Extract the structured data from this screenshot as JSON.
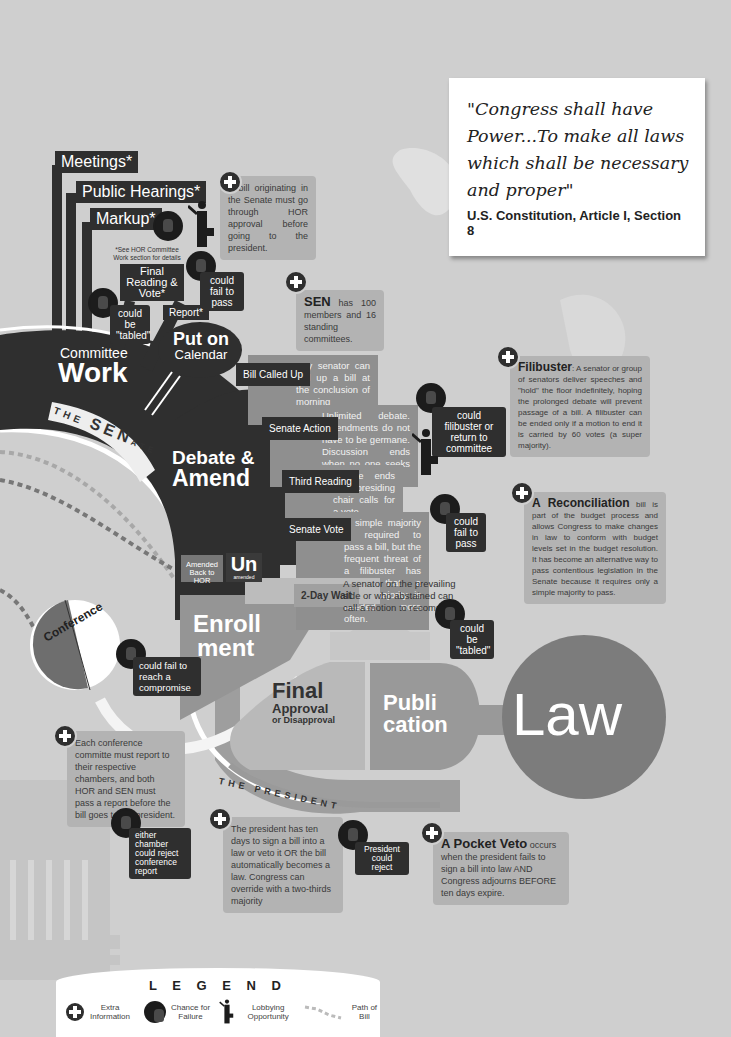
{
  "quote": {
    "text": "\"Congress shall have Power...To make all laws which shall be necessary and proper\"",
    "citation": "U.S. Constitution, Article I, Section 8"
  },
  "committee": {
    "tabs": [
      "Meetings*",
      "Public Hearings*",
      "Markup*"
    ],
    "footnote": "*See HOR Committee Work section for details",
    "final_reading": "Final Reading & Vote*",
    "report": "Report*",
    "title_small": "Committee",
    "title_big": "Work",
    "fail_pass": "could fail to pass",
    "tabled": "could be \"tabled\""
  },
  "senate_label": {
    "the": "THE",
    "sen": "SEN",
    "ate": "ATE"
  },
  "president_label": "THE PRESIDENT",
  "calendar": {
    "line1": "Put on",
    "line2": "Calendar"
  },
  "debate": {
    "line1": "Debate &",
    "line2": "Amend"
  },
  "steps": [
    {
      "label": "Bill Called Up",
      "text": "Any senator can call up a bill at the conclusion of morning business."
    },
    {
      "label": "Senate Action",
      "text": "Unlimited debate. Amendments do not have to be germane. Discussion ends when no one seeks to be recognized."
    },
    {
      "label": "Third Reading",
      "text": "Debate ends and presiding chair calls for a vote."
    },
    {
      "label": "Senate Vote",
      "text": "A simple majority is required to pass a bill, but the frequent threat of a filibuster has meant that a super majority is needed more often."
    },
    {
      "label": "2-Day Wait",
      "text": "A senator on the prevailing side or who abstained can call a motion to recommit."
    }
  ],
  "failures": {
    "filibuster": "could filibuster or return to committee",
    "vote_fail": "could fail to pass",
    "tabled": "could be \"tabled\"",
    "compromise": "could fail to reach a compromise",
    "conference_reject": "either chamber could reject conference report",
    "president_reject": "President could reject"
  },
  "amended": {
    "back": "Amended Back to HOR",
    "un_big": "Un",
    "un_small": "amended"
  },
  "enrollment": {
    "line1": "Enroll",
    "line2": "ment"
  },
  "conference": "Conference",
  "final_approval": {
    "big": "Final",
    "mid": "Approval",
    "small": "or Disapproval"
  },
  "publication": {
    "line1": "Publi",
    "line2": "cation"
  },
  "law": "Law",
  "info_boxes": {
    "hor_approval": "A bill originating in the Senate must go through HOR approval before going to the president.",
    "sen_members": {
      "bold": "SEN",
      "text": "has 100 members and 16 standing committees."
    },
    "filibuster": {
      "bold": "Filibuster",
      "text": ": A senator or group of senators deliver speeches and \"hold\" the floor indefinitely, hoping the prolonged debate will prevent passage of a bill. A filibuster can be ended only if a motion to end it is carried by 60 votes (a super majority)."
    },
    "reconciliation": {
      "bold": "A Reconciliation",
      "text": " bill is part of the budget process and allows Congress to make changes in law to conform with budget levels set in the budget resolution. It has become an alternative way to pass contentious legislation in the Senate because it requires only a simple majority to pass."
    },
    "conference": "Each conference committe must report to their respective chambers, and both HOR and SEN must pass a report before the bill goes to the president.",
    "president": "The president has ten days to sign a bill into a law or veto it OR the bill automatically becomes a law. Congress can override with a two-thirds majority",
    "pocket_veto": {
      "bold": "A Pocket Veto",
      "text": " occurs when the president fails to sign a bill into law AND Congress adjourns BEFORE ten days expire."
    }
  },
  "legend": {
    "title": "L E G E N D",
    "items": [
      {
        "icon": "plus-circle-icon",
        "label": "Extra Information"
      },
      {
        "icon": "burst-hand-icon",
        "label": "Chance for Failure"
      },
      {
        "icon": "lobbyist-icon",
        "label": "Lobbying Opportunity"
      },
      {
        "icon": "arrow-path-icon",
        "label": "Path of Bill"
      }
    ]
  },
  "colors": {
    "background": "#cfcfcf",
    "dark": "#2f2f2f",
    "mid_gray": "#8f8f8f",
    "info_gray": "#b3b3b3",
    "law_circle": "#7c7c7c",
    "publication": "#9a9a9a"
  }
}
